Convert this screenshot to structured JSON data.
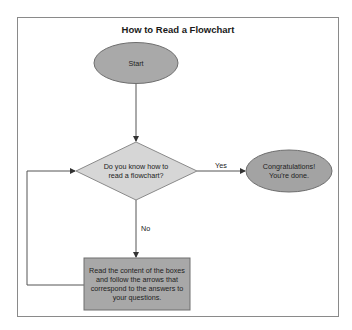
{
  "diagram": {
    "title": "How to Read a Flowchart",
    "nodes": {
      "start": {
        "type": "terminator",
        "label": "Start"
      },
      "decision": {
        "type": "decision",
        "label": "Do you know how to read a flowchart?"
      },
      "done": {
        "type": "terminator",
        "label": "Congratulations! You're done."
      },
      "process": {
        "type": "process",
        "label": "Read the content of the boxes and follow the arrows that correspond to the answers to your questions."
      }
    },
    "edges": [
      {
        "from": "start",
        "to": "decision",
        "label": ""
      },
      {
        "from": "decision",
        "to": "done",
        "label": "Yes"
      },
      {
        "from": "decision",
        "to": "process",
        "label": "No"
      },
      {
        "from": "process",
        "to": "decision",
        "label": ""
      }
    ],
    "colors": {
      "start_fill": "#a9a9a9",
      "decision_fill": "#d6d6d6",
      "done_fill": "#a3a3a3",
      "process_fill": "#a8a8a8",
      "stroke": "#6e6e6e",
      "line": "#555555"
    }
  }
}
